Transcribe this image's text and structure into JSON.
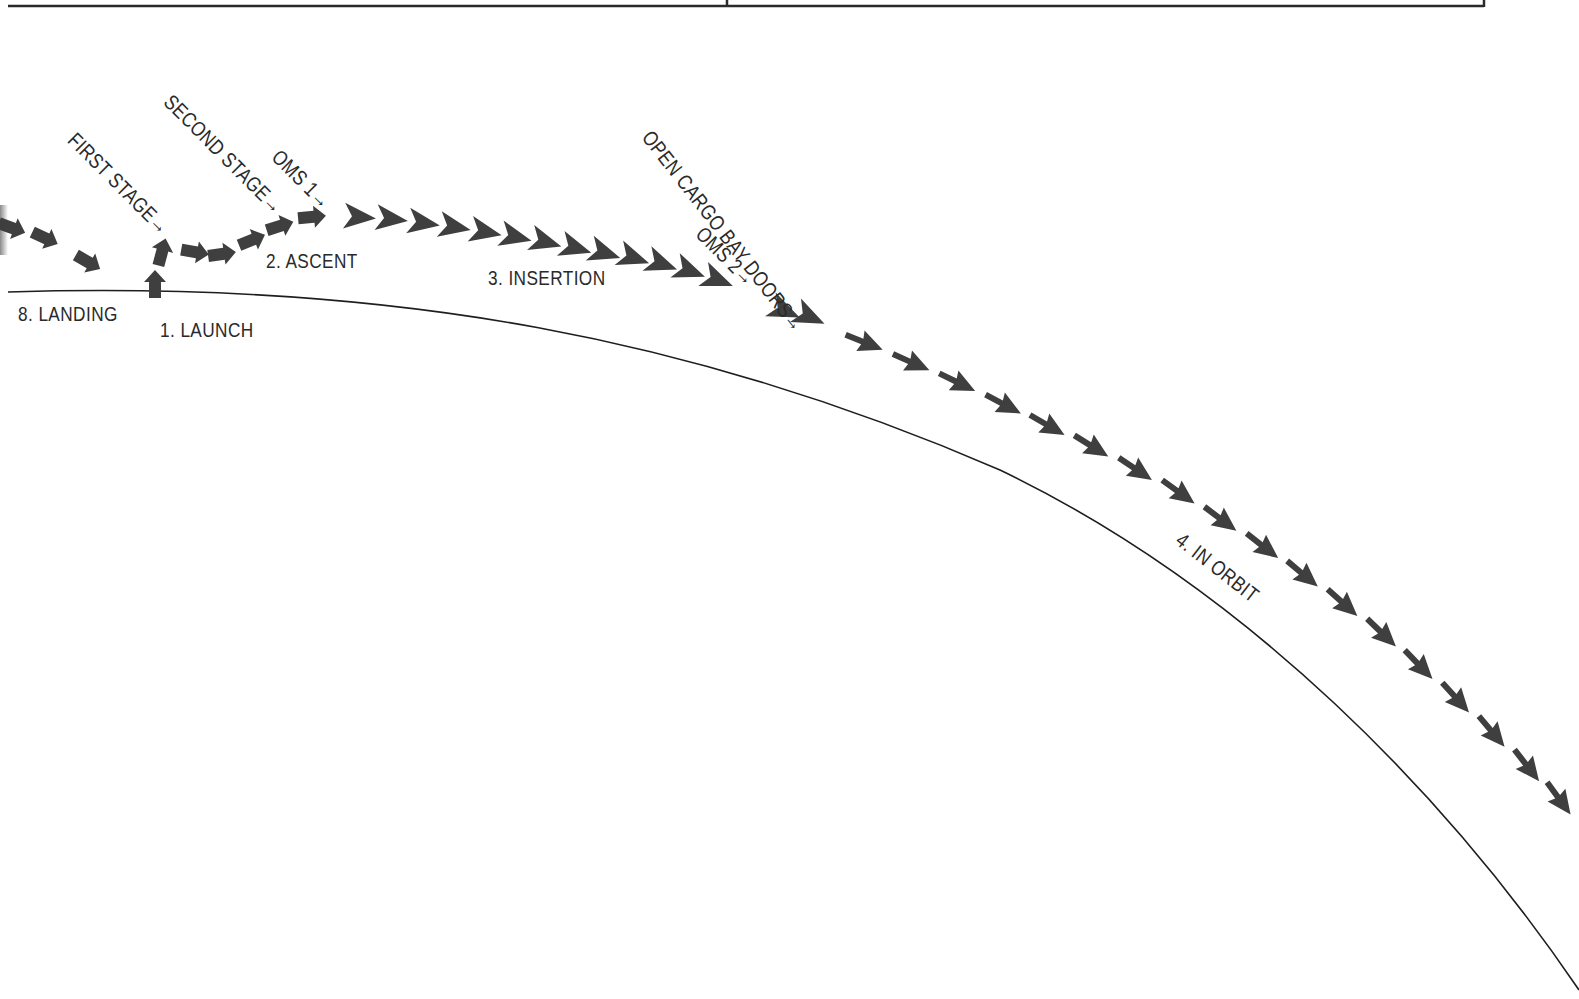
{
  "figure": {
    "colors": {
      "arrow": "#3f3f3f",
      "earth_line": "#1e1e1e",
      "text": "#2a2a2a",
      "table_border": "#2a2a2a"
    }
  },
  "table_top": {
    "bottom_line": {
      "x1": 8,
      "x2": 1484,
      "y": 6
    },
    "divider_x": 727,
    "right_edge_x": 1484
  },
  "phases": {
    "launch": "1. LAUNCH",
    "ascent": "2. ASCENT",
    "insertion": "3. INSERTION",
    "in_orbit": "4. IN ORBIT",
    "landing": "8. LANDING"
  },
  "events": {
    "first_stage": "FIRST STAGE→",
    "second_stage": "SECOND STAGE→",
    "oms1": "OMS 1→",
    "oms2": "OMS 2→",
    "open_cargo_bay_doors": "OPEN CARGO BAY DOORS→"
  },
  "earth_curve": {
    "path": "M 8 292 C 400 280, 700 340, 1000 470 C 1250 590, 1450 800, 1579 990"
  },
  "arrows": {
    "launch": [
      {
        "x": 155,
        "y": 284,
        "angle": -90,
        "kind": "blunt"
      },
      {
        "x": 162,
        "y": 252,
        "angle": -75,
        "kind": "blunt"
      }
    ],
    "ascent": [
      {
        "x": 195,
        "y": 252,
        "angle": 10,
        "kind": "blunt"
      },
      {
        "x": 222,
        "y": 254,
        "angle": -8,
        "kind": "blunt"
      },
      {
        "x": 252,
        "y": 240,
        "angle": -22,
        "kind": "blunt"
      },
      {
        "x": 280,
        "y": 226,
        "angle": -18,
        "kind": "blunt"
      },
      {
        "x": 312,
        "y": 217,
        "angle": -5,
        "kind": "blunt"
      }
    ],
    "insertion": [
      {
        "x": 360,
        "y": 217,
        "angle": 5
      },
      {
        "x": 392,
        "y": 219,
        "angle": 7
      },
      {
        "x": 424,
        "y": 223,
        "angle": 9
      },
      {
        "x": 455,
        "y": 227,
        "angle": 11
      },
      {
        "x": 486,
        "y": 232,
        "angle": 12
      },
      {
        "x": 516,
        "y": 237,
        "angle": 14
      },
      {
        "x": 546,
        "y": 242,
        "angle": 16
      },
      {
        "x": 576,
        "y": 248,
        "angle": 17
      },
      {
        "x": 605,
        "y": 253,
        "angle": 18
      },
      {
        "x": 634,
        "y": 258,
        "angle": 19
      },
      {
        "x": 662,
        "y": 264,
        "angle": 20
      },
      {
        "x": 690,
        "y": 271,
        "angle": 21
      },
      {
        "x": 718,
        "y": 280,
        "angle": 22
      },
      {
        "x": 785,
        "y": 311,
        "angle": 24
      },
      {
        "x": 810,
        "y": 317,
        "angle": 25
      }
    ],
    "orbit": [
      {
        "x": 866,
        "y": 343,
        "angle": 22
      },
      {
        "x": 913,
        "y": 363,
        "angle": 24
      },
      {
        "x": 959,
        "y": 383,
        "angle": 26
      },
      {
        "x": 1005,
        "y": 405,
        "angle": 28
      },
      {
        "x": 1049,
        "y": 426,
        "angle": 30
      },
      {
        "x": 1093,
        "y": 447,
        "angle": 32
      },
      {
        "x": 1137,
        "y": 470,
        "angle": 34
      },
      {
        "x": 1180,
        "y": 493,
        "angle": 36
      },
      {
        "x": 1222,
        "y": 520,
        "angle": 37
      },
      {
        "x": 1264,
        "y": 547,
        "angle": 38
      },
      {
        "x": 1304,
        "y": 575,
        "angle": 40
      },
      {
        "x": 1344,
        "y": 604,
        "angle": 42
      },
      {
        "x": 1383,
        "y": 634,
        "angle": 44
      },
      {
        "x": 1420,
        "y": 666,
        "angle": 46
      },
      {
        "x": 1457,
        "y": 699,
        "angle": 48
      },
      {
        "x": 1493,
        "y": 733,
        "angle": 50
      },
      {
        "x": 1528,
        "y": 767,
        "angle": 52
      },
      {
        "x": 1560,
        "y": 800,
        "angle": 54
      }
    ],
    "landing": [
      {
        "x": 12,
        "y": 228,
        "angle": 20,
        "kind": "blunt"
      },
      {
        "x": 45,
        "y": 238,
        "angle": 25,
        "kind": "blunt"
      },
      {
        "x": 88,
        "y": 262,
        "angle": 30,
        "kind": "blunt"
      }
    ]
  }
}
